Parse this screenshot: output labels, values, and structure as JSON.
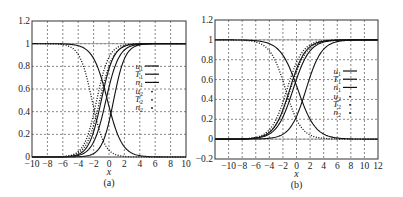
{
  "figure": {
    "panels": [
      {
        "id": "a",
        "caption": "(a)",
        "xlabel": "x",
        "frame": {
          "left": 32,
          "right": 186,
          "top": 21,
          "bottom": 157
        },
        "xlim": [
          -10,
          10
        ],
        "ylim": [
          0,
          1.2
        ],
        "xticks": [
          -10,
          -8,
          -6,
          -4,
          -2,
          0,
          2,
          4,
          6,
          8,
          10
        ],
        "xtick_labels": [
          "−10",
          "−8",
          "−6",
          "−4",
          "−2",
          "0",
          "2",
          "4",
          "6",
          "8",
          "10"
        ],
        "yticks": [
          0,
          0.2,
          0.4,
          0.6,
          0.8,
          1,
          1.2
        ],
        "ytick_labels": [
          "0",
          "0.2",
          "0.4",
          "0.6",
          "0.8",
          "1",
          "1.2"
        ],
        "legend": {
          "x": 143,
          "y": 66
        }
      },
      {
        "id": "b",
        "caption": "(b)",
        "xlabel": "x",
        "frame": {
          "left": 215,
          "right": 378,
          "top": 20,
          "bottom": 159
        },
        "xlim": [
          -12,
          12
        ],
        "ylim": [
          -0.2,
          1.2
        ],
        "xticks": [
          -10,
          -8,
          -6,
          -4,
          -2,
          0,
          2,
          4,
          6,
          8,
          10,
          12
        ],
        "xtick_labels": [
          "−10",
          "−8",
          "−6",
          "−4",
          "−2",
          "0",
          "2",
          "4",
          "6",
          "8",
          "10",
          "12"
        ],
        "yticks": [
          -0.2,
          0,
          0.2,
          0.4,
          0.6,
          0.8,
          1,
          1.2
        ],
        "ytick_labels": [
          "−0.2",
          "0",
          "0.2",
          "0.4",
          "0.6",
          "0.8",
          "1",
          "1.2"
        ],
        "legend": {
          "x": 341,
          "y": 71
        }
      }
    ],
    "legend_entries": [
      {
        "var": "u",
        "sub": "1",
        "style": "solid"
      },
      {
        "var": "T",
        "sub": "1",
        "style": "solid"
      },
      {
        "var": "n",
        "sub": "1",
        "style": "solid"
      },
      {
        "var": "u",
        "sub": "2",
        "style": "dotted"
      },
      {
        "var": "T",
        "sub": "2",
        "style": "dotted"
      },
      {
        "var": "n",
        "sub": "2",
        "style": "dotted"
      }
    ]
  },
  "chart_data": [
    {
      "type": "line",
      "title": "(a)",
      "xlabel": "x",
      "ylabel": "",
      "xlim": [
        -10,
        10
      ],
      "ylim": [
        0,
        1.2
      ],
      "grid": true,
      "legend_position": "right-inside",
      "series": [
        {
          "name": "u1",
          "style": "solid",
          "shape": "sigmoid-up",
          "center": -1.0,
          "width": 1.6
        },
        {
          "name": "T1",
          "style": "solid",
          "shape": "sigmoid-up",
          "center": -0.4,
          "width": 1.7
        },
        {
          "name": "n1",
          "style": "solid",
          "shape": "sigmoid-down",
          "center": -0.2,
          "width": 1.9
        },
        {
          "name": "u2",
          "style": "dotted",
          "shape": "sigmoid-up",
          "center": -1.6,
          "width": 1.6
        },
        {
          "name": "T2",
          "style": "dotted",
          "shape": "sigmoid-up",
          "center": -1.2,
          "width": 1.7
        },
        {
          "name": "n2",
          "style": "dotted",
          "shape": "sigmoid-down",
          "center": -2.2,
          "width": 1.6
        },
        {
          "name": "u1 (outer)",
          "style": "solid",
          "shape": "sigmoid-up",
          "center": 0.6,
          "width": 1.5
        }
      ]
    },
    {
      "type": "line",
      "title": "(b)",
      "xlabel": "x",
      "ylabel": "",
      "xlim": [
        -12,
        12
      ],
      "ylim": [
        -0.2,
        1.2
      ],
      "grid": true,
      "legend_position": "right-inside",
      "series": [
        {
          "name": "u1",
          "style": "solid",
          "shape": "sigmoid-up",
          "center": -1.0,
          "width": 2.3
        },
        {
          "name": "T1",
          "style": "solid",
          "shape": "sigmoid-up",
          "center": -0.5,
          "width": 2.4
        },
        {
          "name": "n1",
          "style": "solid",
          "shape": "sigmoid-down",
          "center": 0.2,
          "width": 2.6
        },
        {
          "name": "u2",
          "style": "dotted",
          "shape": "sigmoid-up",
          "center": -1.4,
          "width": 2.3
        },
        {
          "name": "T2",
          "style": "dotted",
          "shape": "sigmoid-up",
          "center": -0.9,
          "width": 2.4
        },
        {
          "name": "n2",
          "style": "dotted",
          "shape": "sigmoid-down",
          "center": -1.6,
          "width": 2.3
        },
        {
          "name": "u1 (outer)",
          "style": "solid",
          "shape": "sigmoid-up",
          "center": 1.4,
          "width": 2.3
        }
      ]
    }
  ]
}
